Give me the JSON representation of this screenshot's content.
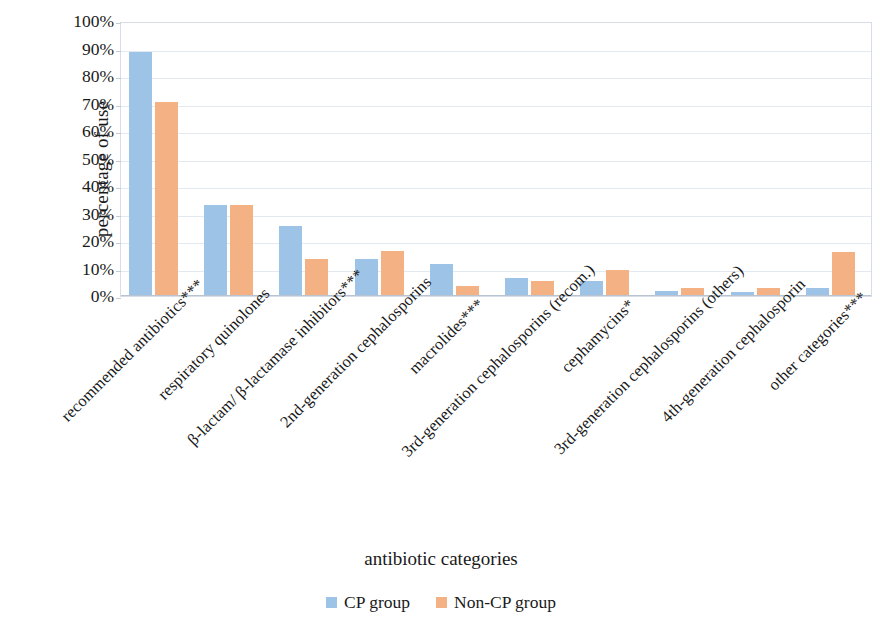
{
  "chart_data": {
    "type": "bar",
    "title": "",
    "xlabel": "antibiotic categories",
    "ylabel": "percentage of use",
    "ylim": [
      0,
      100
    ],
    "ytick_labels": [
      "0%",
      "10%",
      "20%",
      "30%",
      "40%",
      "50%",
      "60%",
      "70%",
      "80%",
      "90%",
      "100%"
    ],
    "ytick_values": [
      0,
      10,
      20,
      30,
      40,
      50,
      60,
      70,
      80,
      90,
      100
    ],
    "grid": true,
    "legend_position": "bottom-center",
    "categories": [
      "recommended antibiotics***",
      "respiratory quinolones",
      "β-lactam/ β-lactamase inhibitors***",
      "2nd-generation cephalosporins",
      "macrolides***",
      "3rd-generation cephalosporins (recom.)",
      "cephamycins*",
      "3rd-generation cephalosporins (others)",
      "4th-generation cephalosporin",
      "other categories***"
    ],
    "series": [
      {
        "name": "CP group",
        "color": "#9DC3E6",
        "values": [
          88.8,
          33.0,
          25.5,
          13.5,
          11.5,
          6.5,
          5.5,
          2.0,
          1.3,
          3.0
        ]
      },
      {
        "name": "Non-CP group",
        "color": "#F4B183",
        "values": [
          70.5,
          33.0,
          13.5,
          16.5,
          3.5,
          5.5,
          9.5,
          2.8,
          3.0,
          16.0
        ]
      }
    ]
  },
  "legend": {
    "entries": [
      {
        "label": "CP group",
        "color": "#9DC3E6"
      },
      {
        "label": "Non-CP group",
        "color": "#F4B183"
      }
    ]
  }
}
